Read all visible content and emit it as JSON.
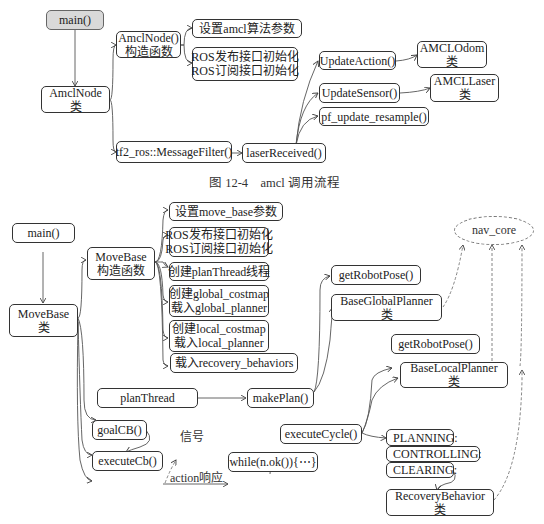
{
  "figure1": {
    "caption": "图 12-4    amcl 调用流程",
    "nodes": {
      "main": "main()",
      "amclnode_class": [
        "AmclNode",
        "类"
      ],
      "amclnode_ctor": [
        "AmclNode()",
        "构造函数"
      ],
      "set_params": "设置amcl算法参数",
      "ros_init": [
        "ROS发布接口初始化",
        "ROS订阅接口初始化"
      ],
      "message_filter": "tf2_ros::MessageFilter()",
      "laser_received": "laserReceived()",
      "update_action": "UpdateAction()",
      "amcl_odom": [
        "AMCLOdom",
        "类"
      ],
      "update_sensor": "UpdateSensor()",
      "amcl_laser": [
        "AMCLLaser",
        "类"
      ],
      "pf_update_resample": "pf_update_resample()"
    }
  },
  "figure2": {
    "nodes": {
      "main": "main()",
      "movebase_class": [
        "MoveBase",
        "类"
      ],
      "movebase_ctor": [
        "MoveBase",
        "构造函数"
      ],
      "set_params": "设置move_base参数",
      "ros_init": [
        "ROS发布接口初始化",
        "ROS订阅接口初始化"
      ],
      "create_thread": "创建planThread线程",
      "global": [
        "创建global_costmap",
        "载入global_planner"
      ],
      "local": [
        "创建local_costmap",
        "载入local_planner"
      ],
      "recovery": "载入recovery_behaviors",
      "plan_thread": "planThread",
      "make_plan": "makePlan()",
      "goal_cb": "goalCB()",
      "execute_cb": "executeCb()",
      "while_loop": "while(n.ok()){⋯}",
      "execute_cycle": "executeCycle()",
      "get_robot_pose_1": "getRobotPose()",
      "base_global_planner": [
        "BaseGlobalPlanner",
        "类"
      ],
      "get_robot_pose_2": "getRobotPose()",
      "base_local_planner": [
        "BaseLocalPlanner",
        "类"
      ],
      "planning": "PLANNING:",
      "controlling": "CONTROLLING:",
      "clearing": "CLEARING:",
      "recovery_behavior": [
        "RecoveryBehavior",
        "类"
      ],
      "nav_core": "nav_core"
    },
    "labels": {
      "signal": "信号",
      "action_response": "action响应"
    }
  },
  "colors": {
    "line": "#444444",
    "node_border": "#333333",
    "main_fill_fig1": "#d9d9d9",
    "dashed": "#777777"
  }
}
